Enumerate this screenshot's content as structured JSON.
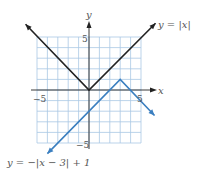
{
  "chart_data": {
    "type": "line",
    "title": "",
    "xlabel": "x",
    "ylabel": "y",
    "xlim": [
      -5,
      5
    ],
    "ylim": [
      -5,
      5
    ],
    "grid": true,
    "x_tick_labels": [
      "-5",
      "5"
    ],
    "y_tick_labels": [
      "5",
      "-5"
    ],
    "series": [
      {
        "name": "y = |x|",
        "color": "#222222",
        "points": [
          [
            -6.1,
            6.2
          ],
          [
            0,
            0
          ],
          [
            6.4,
            6.3
          ]
        ],
        "vertex": [
          0,
          0
        ]
      },
      {
        "name": "y = −|x − 3| + 1",
        "color": "#3b7fc0",
        "points": [
          [
            -4,
            -6
          ],
          [
            3,
            1
          ],
          [
            6.3,
            -2.4
          ]
        ],
        "vertex": [
          3,
          1
        ]
      }
    ]
  },
  "labels": {
    "x_axis": "x",
    "y_axis": "y",
    "x_min": "−5",
    "x_max": "5",
    "y_max": "5",
    "y_min": "−5",
    "series_black": "y = |x|",
    "series_blue": "y = −|x − 3| + 1"
  },
  "colors": {
    "grid": "#a9c8e4",
    "axis": "#222222",
    "black_line": "#222222",
    "blue_line": "#3b7fc0"
  }
}
